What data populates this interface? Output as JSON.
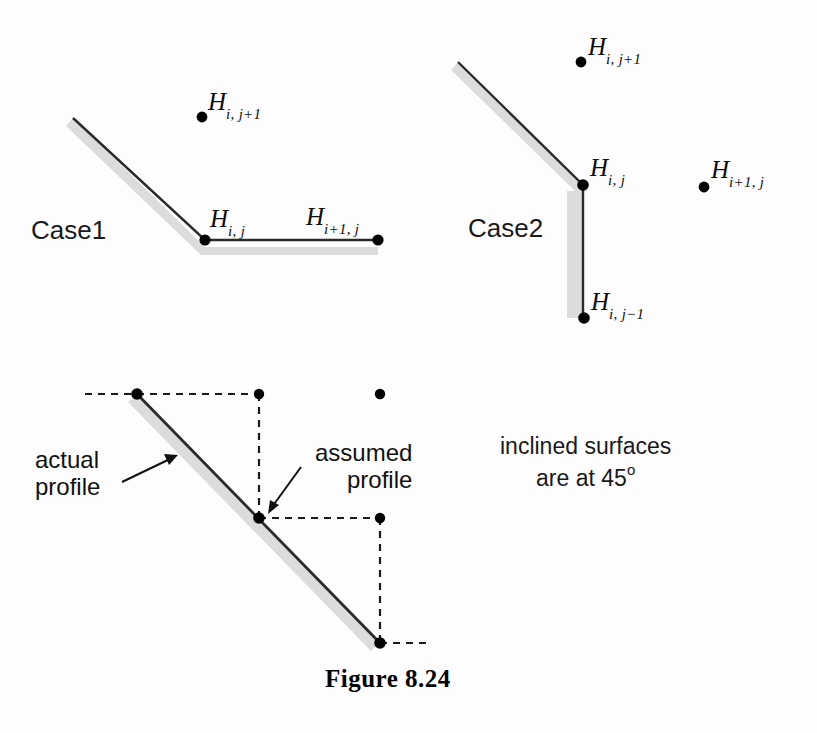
{
  "figure": {
    "caption": "Figure 8.24",
    "note_line1": "inclined surfaces",
    "note_line2_prefix": "are at 45",
    "note_line2_deg": "o"
  },
  "case1": {
    "label": "Case1",
    "node_labels": [
      {
        "base": "H",
        "sub": "i, j+1"
      },
      {
        "base": "H",
        "sub": "i, j"
      },
      {
        "base": "H",
        "sub": "i+1, j"
      }
    ]
  },
  "case2": {
    "label": "Case2",
    "node_labels": [
      {
        "base": "H",
        "sub": "i, j+1"
      },
      {
        "base": "H",
        "sub": "i, j"
      },
      {
        "base": "H",
        "sub": "i+1, j"
      },
      {
        "base": "H",
        "sub": "i, j−1"
      }
    ]
  },
  "profile_diagram": {
    "actual_label_line1": "actual",
    "actual_label_line2": "profile",
    "assumed_label_line1": "assumed",
    "assumed_label_line2": "profile"
  },
  "colors": {
    "ink": "#1a1a1a",
    "line": "#2b2b2b",
    "shadow": "#d9d9d9",
    "dot": "#000000",
    "background": "#fdfdfd"
  }
}
